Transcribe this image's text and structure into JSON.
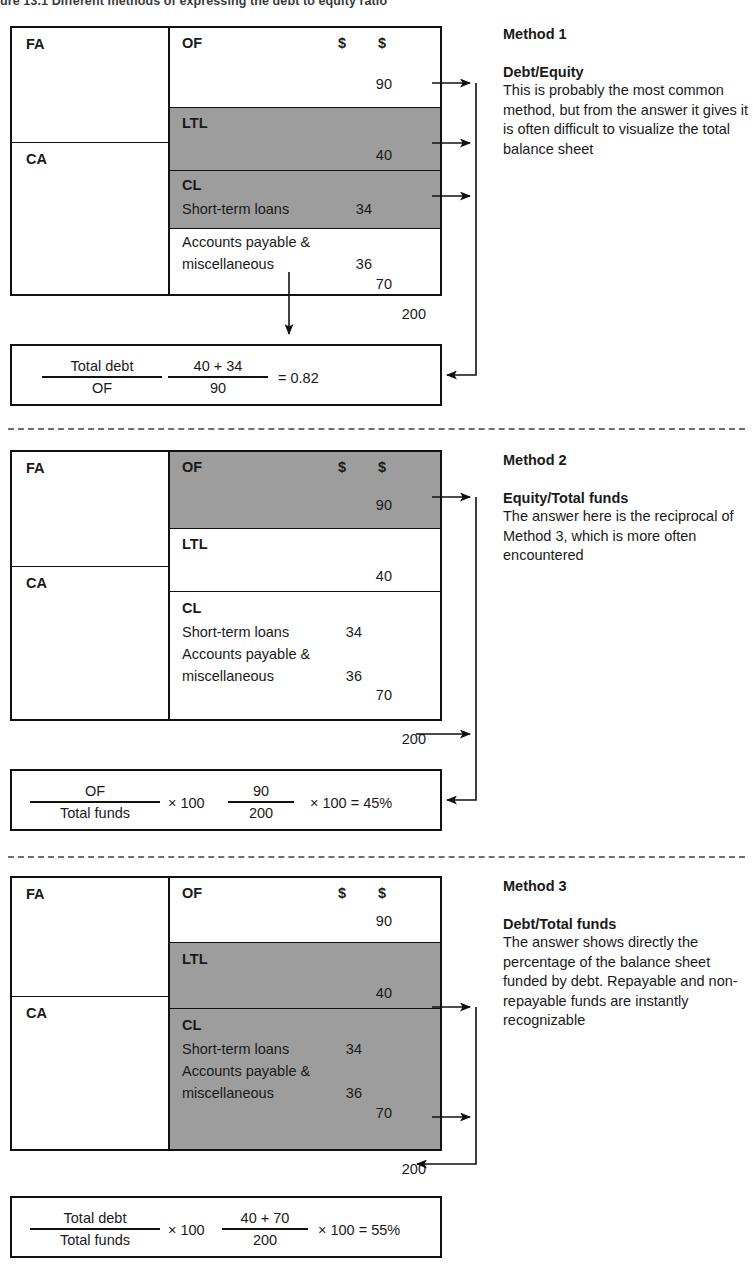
{
  "caption": "ure 13.1  Different methods of expressing the debt to equity ratio",
  "labels": {
    "fa": "FA",
    "ca": "CA",
    "of": "OF",
    "ltl": "LTL",
    "cl": "CL",
    "short_term_loans": "Short-term loans",
    "accounts_payable_line1": "Accounts payable &",
    "accounts_payable_line2": "miscellaneous",
    "dollar": "$"
  },
  "values": {
    "of": "90",
    "ltl": "40",
    "short_term_loans": "34",
    "accounts_payable": "36",
    "cl_total": "70",
    "grand_total": "200"
  },
  "methods": [
    {
      "title": "Method 1",
      "subtitle": "Debt/Equity",
      "body": "This is probably the most common method, but from the answer it gives it is often difficult to visualize the  total balance sheet",
      "shaded": "ltl-and-short-term-loans",
      "formula": {
        "num1": "Total debt",
        "den1": "OF",
        "mid": "",
        "num2": "40 + 34",
        "den2": "90",
        "result": "= 0.82"
      }
    },
    {
      "title": "Method 2",
      "subtitle": "Equity/Total funds",
      "body": "The answer here is the reciprocal of Method 3, which is more often encountered",
      "shaded": "of",
      "formula": {
        "num1": "OF",
        "den1": "Total funds",
        "mid": "× 100",
        "num2": "90",
        "den2": "200",
        "result": "× 100 = 45%"
      }
    },
    {
      "title": "Method 3",
      "subtitle": "Debt/Total funds",
      "body": "The answer shows directly the percentage of the balance sheet funded by debt. Repayable and non-repayable funds are instantly recognizable",
      "shaded": "ltl-and-cl",
      "formula": {
        "num1": "Total debt",
        "den1": "Total funds",
        "mid": "× 100",
        "num2": "40 + 70",
        "den2": "200",
        "result": "× 100 = 55%"
      }
    }
  ],
  "colors": {
    "shade_gray": "#9d9d9d",
    "line": "#111111",
    "dash": "#6f6f6f"
  }
}
